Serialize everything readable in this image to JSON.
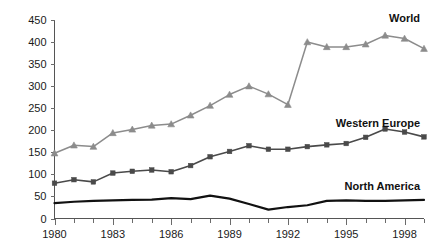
{
  "chart_data": {
    "type": "line",
    "title": "",
    "subtitle": "",
    "xlabel": "",
    "ylabel": "",
    "xlim": [
      1980,
      1999
    ],
    "ylim": [
      0,
      450
    ],
    "grid": false,
    "legend_position": "inline-right",
    "y_ticks": [
      0,
      50,
      100,
      150,
      200,
      250,
      300,
      350,
      400,
      450
    ],
    "y_tick_labels": [
      "0",
      "50",
      "100",
      "150",
      "200",
      "250",
      "300",
      "350",
      "400",
      "450"
    ],
    "x_ticks": [
      1980,
      1981,
      1982,
      1983,
      1984,
      1985,
      1986,
      1987,
      1988,
      1989,
      1990,
      1991,
      1992,
      1993,
      1994,
      1995,
      1996,
      1997,
      1998,
      1999
    ],
    "x_tick_labels_shown": [
      "1980",
      "1983",
      "1986",
      "1989",
      "1992",
      "1995",
      "1998"
    ],
    "x_labeled_years": [
      1980,
      1983,
      1986,
      1989,
      1992,
      1995,
      1998
    ],
    "x": [
      1980,
      1981,
      1982,
      1983,
      1984,
      1985,
      1986,
      1987,
      1988,
      1989,
      1990,
      1991,
      1992,
      1993,
      1994,
      1995,
      1996,
      1997,
      1998,
      1999
    ],
    "series": [
      {
        "name": "World",
        "color": "#8c8c8c",
        "marker": "triangle",
        "label_text": "World",
        "values": [
          148,
          166,
          163,
          194,
          202,
          211,
          214,
          234,
          256,
          281,
          300,
          282,
          258,
          400,
          389,
          389,
          395,
          415,
          408,
          385
        ]
      },
      {
        "name": "Western Europe",
        "color": "#4a4a4a",
        "marker": "square",
        "label_text": "Western Europe",
        "values": [
          80,
          88,
          83,
          103,
          107,
          110,
          106,
          120,
          140,
          152,
          165,
          157,
          157,
          163,
          167,
          170,
          184,
          203,
          196,
          185
        ]
      },
      {
        "name": "North America",
        "color": "#111111",
        "marker": "none",
        "label_text": "North America",
        "values": [
          35,
          38,
          40,
          41,
          42,
          43,
          46,
          44,
          52,
          45,
          33,
          20,
          26,
          30,
          40,
          41,
          40,
          40,
          41,
          42
        ]
      }
    ],
    "annotations": [
      {
        "text": "World",
        "series": "World"
      },
      {
        "text": "Western Europe",
        "series": "Western Europe"
      },
      {
        "text": "North America",
        "series": "North America"
      }
    ]
  },
  "colors": {
    "world": "#8c8c8c",
    "western_europe": "#4a4a4a",
    "north_america": "#111111",
    "axis": "#555555",
    "text": "#1a1a1a",
    "background": "#ffffff"
  }
}
